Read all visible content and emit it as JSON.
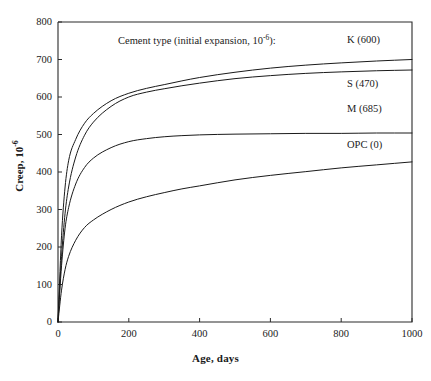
{
  "chart_data": {
    "type": "line",
    "xlabel": "Age, days",
    "ylabel": "Creep, 10⁻⁶",
    "xlim": [
      0,
      1000
    ],
    "ylim": [
      0,
      800
    ],
    "xticks": [
      0,
      200,
      400,
      600,
      800,
      1000
    ],
    "yticks": [
      0,
      100,
      200,
      300,
      400,
      500,
      600,
      700,
      800
    ],
    "grid": false,
    "legend_position": "inline-right",
    "x": [
      0,
      5,
      10,
      20,
      30,
      50,
      75,
      100,
      150,
      200,
      250,
      300,
      350,
      400,
      500,
      600,
      700,
      800,
      900,
      1000
    ],
    "series": [
      {
        "name": "K (600)",
        "label": "K (600)",
        "initial_expansion": 600,
        "values": [
          0,
          120,
          230,
          360,
          430,
          487,
          530,
          556,
          590,
          610,
          623,
          633,
          643,
          652,
          666,
          677,
          685,
          691,
          696,
          700
        ]
      },
      {
        "name": "S (470)",
        "label": "S (470)",
        "initial_expansion": 470,
        "values": [
          0,
          95,
          175,
          290,
          360,
          440,
          498,
          533,
          575,
          600,
          613,
          622,
          630,
          637,
          649,
          657,
          663,
          667,
          670,
          672
        ]
      },
      {
        "name": "M (685)",
        "label": "M (685)",
        "initial_expansion": 685,
        "values": [
          0,
          80,
          150,
          250,
          305,
          368,
          412,
          437,
          465,
          481,
          489,
          494,
          497,
          499,
          501,
          502,
          503,
          503,
          504,
          504
        ]
      },
      {
        "name": "OPC (0)",
        "label": "OPC (0)",
        "initial_expansion": 0,
        "values": [
          0,
          45,
          85,
          140,
          175,
          218,
          252,
          272,
          300,
          320,
          334,
          345,
          355,
          363,
          379,
          391,
          401,
          411,
          419,
          427
        ]
      }
    ],
    "annotations": [
      {
        "text": "K (600)",
        "x": 1000,
        "y": 745
      },
      {
        "text": "S (470)",
        "x": 1000,
        "y": 627
      },
      {
        "text": "M (685)",
        "x": 1000,
        "y": 560
      },
      {
        "text": "OPC (0)",
        "x": 1000,
        "y": 465
      }
    ],
    "colors": {
      "curve": "#1a1a1a",
      "axis": "#2b2b2b",
      "background": "#ffffff"
    }
  },
  "labels": {
    "ytick_0": "0",
    "ytick_100": "100",
    "ytick_200": "200",
    "ytick_300": "300",
    "ytick_400": "400",
    "ytick_500": "500",
    "ytick_600": "600",
    "ytick_700": "700",
    "ytick_800": "800",
    "xtick_0": "0",
    "xtick_200": "200",
    "xtick_400": "400",
    "xtick_600": "600",
    "xtick_800": "800",
    "xtick_1000": "1000",
    "title_main": "Cement type (initial expansion, 10",
    "title_exp": "-6",
    "title_tail": "):",
    "ylabel_main": "Creep, 10",
    "ylabel_exp": "-6",
    "xlabel": "Age, days",
    "series_k": "K (600)",
    "series_s": "S (470)",
    "series_m": "M (685)",
    "series_opc": "OPC (0)"
  }
}
